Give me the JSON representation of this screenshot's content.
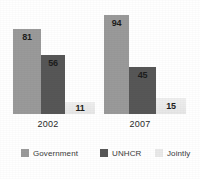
{
  "chart_data": {
    "type": "bar",
    "title": "",
    "xlabel": "",
    "ylabel": "",
    "categories": [
      "2002",
      "2007"
    ],
    "ylim": [
      0,
      100
    ],
    "grid": false,
    "legend_position": "bottom",
    "series": [
      {
        "name": "Government",
        "values": [
          81,
          94
        ],
        "color": "#9a9a9a"
      },
      {
        "name": "UNHCR",
        "values": [
          56,
          45
        ],
        "color": "#575757"
      },
      {
        "name": "Jointly",
        "values": [
          11,
          15
        ],
        "color": "#ebebeb"
      }
    ],
    "data_labels": {
      "2002": {
        "Government": "81",
        "UNHCR": "56",
        "Jointly": "11"
      },
      "2007": {
        "Government": "94",
        "UNHCR": "45",
        "Jointly": "15"
      }
    }
  },
  "legend": {
    "items": [
      {
        "label": "Government",
        "color": "#9a9a9a"
      },
      {
        "label": "UNHCR",
        "color": "#575757"
      },
      {
        "label": "Jointly",
        "color": "#ebebeb"
      }
    ]
  },
  "axis": {
    "category_labels": [
      "2002",
      "2007"
    ]
  }
}
